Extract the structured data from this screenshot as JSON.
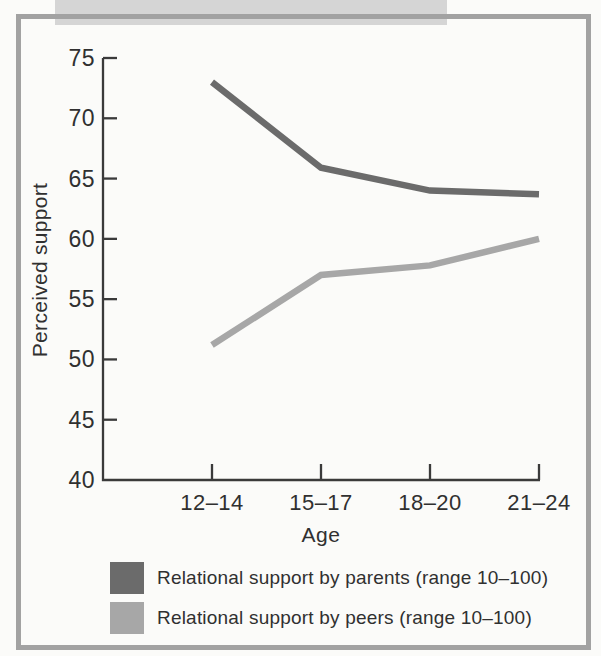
{
  "figure_type": "scanned textbook line chart",
  "chart_data": {
    "type": "line",
    "categories": [
      "12–14",
      "15–17",
      "18–20",
      "21–24"
    ],
    "series": [
      {
        "name": "Relational support by parents (range 10–100)",
        "values": [
          73,
          65.9,
          64,
          63.7
        ],
        "color": "#6b6b6b"
      },
      {
        "name": "Relational support by peers (range 10–100)",
        "values": [
          51.2,
          57,
          57.8,
          60
        ],
        "color": "#a7a7a7"
      }
    ],
    "xlabel": "Age",
    "ylabel": "Perceived support",
    "ylim": [
      40,
      75
    ],
    "yticks": [
      40,
      45,
      50,
      55,
      60,
      65,
      70,
      75
    ],
    "grid": false,
    "legend_position": "bottom"
  },
  "colors": {
    "axis": "#3a3a3a",
    "text": "#303030",
    "frame_border": "#a2a2a2",
    "top_band": "#d5d5d5",
    "page_background": "#fbfbf9"
  }
}
